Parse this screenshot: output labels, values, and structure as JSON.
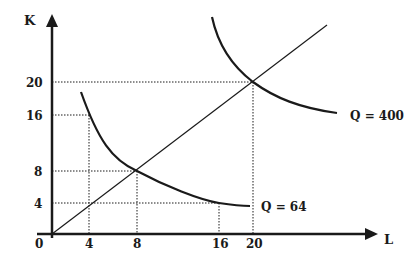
{
  "diagram": {
    "type": "isoquant-expansion-path",
    "colors": {
      "ink": "#1a1a1a",
      "background": "#ffffff"
    },
    "axes": {
      "y_label": "K",
      "x_label": "L",
      "origin_label": "0",
      "y_ticks": [
        {
          "value": 4,
          "label": "4",
          "py": 203
        },
        {
          "value": 8,
          "label": "8",
          "py": 171
        },
        {
          "value": 16,
          "label": "16",
          "py": 115
        },
        {
          "value": 20,
          "label": "20",
          "py": 82
        }
      ],
      "x_ticks": [
        {
          "value": 4,
          "label": "4",
          "px": 89
        },
        {
          "value": 8,
          "label": "8",
          "px": 137
        },
        {
          "value": 16,
          "label": "16",
          "px": 219
        },
        {
          "value": 20,
          "label": "20",
          "px": 253
        }
      ]
    },
    "isoquants": [
      {
        "label": "Q = 64",
        "points": [
          [
            4,
            16
          ],
          [
            8,
            8
          ],
          [
            16,
            4
          ]
        ]
      },
      {
        "label": "Q = 400",
        "points": [
          [
            20,
            20
          ]
        ]
      }
    ],
    "expansion_path": {
      "from": [
        0,
        0
      ],
      "through": [
        [
          4,
          4
        ],
        [
          8,
          8
        ],
        [
          20,
          20
        ]
      ]
    },
    "guides": [
      {
        "from": "K=20",
        "to": "L=20"
      },
      {
        "from": "K=16",
        "to": "L=4"
      },
      {
        "from": "K=8",
        "to": "L=8"
      },
      {
        "from": "K=4",
        "to": "L=16"
      }
    ]
  }
}
